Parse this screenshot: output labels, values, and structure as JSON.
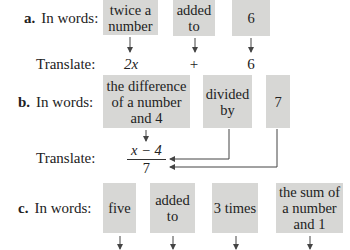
{
  "part_a": {
    "letter": "a.",
    "words_label": "In words:",
    "translate_label": "Translate:",
    "boxes": [
      "twice a number",
      "added to",
      "6"
    ],
    "translations": [
      "2x",
      "+",
      "6"
    ]
  },
  "part_b": {
    "letter": "b.",
    "words_label": "In words:",
    "translate_label": "Translate:",
    "boxes": [
      "the difference of a number and 4",
      "divided by",
      "7"
    ],
    "fraction": {
      "numerator": "x − 4",
      "denominator": "7"
    }
  },
  "part_c": {
    "letter": "c.",
    "words_label": "In words:",
    "boxes": [
      "five",
      "added to",
      "3 times",
      "the sum of a number and 1"
    ]
  },
  "colors": {
    "box_fill": "#d7d7d5",
    "arrow": "#444444"
  }
}
